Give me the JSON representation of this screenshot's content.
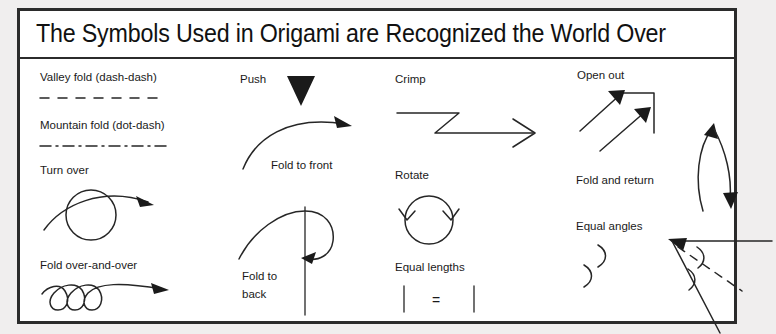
{
  "panel": {
    "title": "The Symbols Used in Origami are Recognized the World Over",
    "background_color": "#ffffff",
    "page_background_color": "#f0eeee",
    "border_color": "#2b2b2b",
    "ink_color": "#262626"
  },
  "columns": [
    {
      "name": "column-1",
      "symbols": [
        {
          "label": "Valley fold (dash-dash)",
          "icon": "dashed-line-icon"
        },
        {
          "label": "Mountain fold (dot-dash)",
          "icon": "dash-dot-line-icon"
        },
        {
          "label": "Turn over",
          "icon": "circle-with-curved-arrow-icon"
        },
        {
          "label": "Fold over-and-over",
          "icon": "three-loops-arrow-icon"
        }
      ]
    },
    {
      "name": "column-2",
      "symbols": [
        {
          "label": "Push",
          "icon": "solid-down-triangle-icon"
        },
        {
          "label": "Fold to front",
          "icon": "curved-arrow-icon"
        },
        {
          "label": "Fold to\nback",
          "label_line1": "Fold to",
          "label_line2": "back",
          "icon": "loop-around-line-arrow-icon"
        }
      ]
    },
    {
      "name": "column-3",
      "symbols": [
        {
          "label": "Crimp",
          "icon": "zigzag-arrow-icon"
        },
        {
          "label": "Rotate",
          "icon": "circular-double-arrow-icon"
        },
        {
          "label": "Equal lengths",
          "icon": "tick-equals-tick-icon",
          "equals_sign": "="
        }
      ]
    },
    {
      "name": "column-4",
      "symbols": [
        {
          "label": "Open out",
          "icon": "double-diagonal-arrows-bracket-icon"
        },
        {
          "label": "Fold and return",
          "icon": "double-headed-curved-arrow-icon"
        },
        {
          "label": "Equal angles",
          "icon": "angle-bisector-arcs-icon"
        }
      ]
    }
  ]
}
